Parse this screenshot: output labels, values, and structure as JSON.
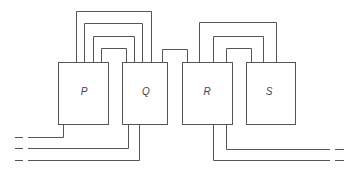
{
  "diagram": {
    "type": "block-wiring-diagram",
    "colors": {
      "line": "#555555",
      "label": "#444444",
      "background": "#ffffff"
    },
    "boxes": [
      {
        "id": "P",
        "label": "P",
        "x": 58,
        "y": 62,
        "w": 50,
        "h": 62
      },
      {
        "id": "Q",
        "label": "Q",
        "x": 122,
        "y": 62,
        "w": 46,
        "h": 62
      },
      {
        "id": "R",
        "label": "R",
        "x": 182,
        "y": 62,
        "w": 50,
        "h": 62
      },
      {
        "id": "S",
        "label": "S",
        "x": 246,
        "y": 62,
        "w": 49,
        "h": 62
      }
    ],
    "top_loops": [
      {
        "from": "P",
        "to": "Q",
        "x1": 76,
        "x2": 151,
        "top": 11
      },
      {
        "from": "P",
        "to": "Q",
        "x1": 84,
        "x2": 142,
        "top": 23
      },
      {
        "from": "P",
        "to": "Q",
        "x1": 93,
        "x2": 134,
        "top": 36
      },
      {
        "from": "P",
        "to": "Q",
        "x1": 101,
        "x2": 126,
        "top": 48
      },
      {
        "from": "Q",
        "to": "R",
        "x1": 162,
        "x2": 187,
        "top": 49
      },
      {
        "from": "R",
        "to": "S",
        "x1": 199,
        "x2": 276,
        "top": 22
      },
      {
        "from": "R",
        "to": "S",
        "x1": 213,
        "x2": 263,
        "top": 36
      },
      {
        "from": "R",
        "to": "S",
        "x1": 226,
        "x2": 251,
        "top": 48
      }
    ],
    "leads": [
      {
        "from": "P",
        "x": 63,
        "y": 137,
        "side": "left",
        "end": 28
      },
      {
        "from": "Q",
        "x": 128,
        "y": 148,
        "side": "left",
        "end": 28
      },
      {
        "from": "Q",
        "x": 139,
        "y": 160,
        "side": "left",
        "end": 28
      },
      {
        "from": "R",
        "x": 226,
        "y": 149,
        "side": "right",
        "end": 330
      },
      {
        "from": "R",
        "x": 213,
        "y": 160,
        "side": "right",
        "end": 330
      }
    ]
  }
}
